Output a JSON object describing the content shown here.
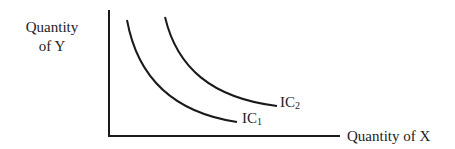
{
  "diagram": {
    "type": "indifference-curves",
    "y_axis_label": {
      "line1": "Quantity",
      "line2": "of Y"
    },
    "x_axis_label": "Quantity of X",
    "curves": [
      {
        "name": "IC",
        "subscript": "1"
      },
      {
        "name": "IC",
        "subscript": "2"
      }
    ],
    "colors": {
      "line": "#1a1a1a",
      "background": "#ffffff"
    }
  }
}
